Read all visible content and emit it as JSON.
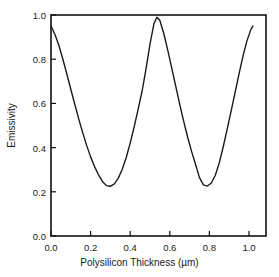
{
  "chart_data": {
    "type": "line",
    "title": "",
    "xlabel": "Polysilicon Thickness (µm)",
    "ylabel": "Emissivity",
    "xlim": [
      0.0,
      1.086
    ],
    "ylim": [
      0.0,
      1.0
    ],
    "xticks": [
      0.0,
      0.2,
      0.4,
      0.6,
      0.8,
      1.0
    ],
    "xtick_labels": [
      "0.0",
      "0.2",
      "0.4",
      "0.6",
      "0.8",
      "1.0"
    ],
    "yticks": [
      0.0,
      0.2,
      0.4,
      0.6,
      0.8,
      1.0
    ],
    "ytick_labels": [
      "0.0",
      "0.2",
      "0.4",
      "0.6",
      "0.8",
      "1.0"
    ],
    "grid": false,
    "legend": false,
    "tick_direction": "in",
    "line_color": "#1a1a1a",
    "line_width": 1.4,
    "frame_color": "#111111",
    "background": "#fefefe",
    "annotations": [
      {
        "label": "start",
        "x": 0.0,
        "y": 0.95
      },
      {
        "label": "minimum-1",
        "x": 0.265,
        "y": 0.225
      },
      {
        "label": "maximum",
        "x": 0.535,
        "y": 0.99
      },
      {
        "label": "minimum-2",
        "x": 0.745,
        "y": 0.225
      },
      {
        "label": "end",
        "x": 1.02,
        "y": 0.95
      }
    ],
    "series": [
      {
        "name": "Emissivity",
        "x": [
          0.0,
          0.02,
          0.04,
          0.06,
          0.08,
          0.1,
          0.12,
          0.14,
          0.16,
          0.18,
          0.2,
          0.22,
          0.24,
          0.26,
          0.28,
          0.3,
          0.32,
          0.34,
          0.36,
          0.38,
          0.4,
          0.42,
          0.44,
          0.46,
          0.48,
          0.5,
          0.52,
          0.535,
          0.55,
          0.57,
          0.59,
          0.61,
          0.63,
          0.65,
          0.67,
          0.69,
          0.71,
          0.73,
          0.75,
          0.77,
          0.79,
          0.81,
          0.83,
          0.85,
          0.87,
          0.89,
          0.91,
          0.93,
          0.95,
          0.97,
          0.99,
          1.01,
          1.02
        ],
        "y": [
          0.95,
          0.912,
          0.862,
          0.8,
          0.733,
          0.664,
          0.596,
          0.53,
          0.468,
          0.41,
          0.358,
          0.314,
          0.277,
          0.247,
          0.228,
          0.225,
          0.236,
          0.262,
          0.302,
          0.355,
          0.42,
          0.494,
          0.573,
          0.655,
          0.756,
          0.868,
          0.961,
          0.99,
          0.975,
          0.915,
          0.84,
          0.76,
          0.678,
          0.597,
          0.52,
          0.448,
          0.383,
          0.325,
          0.264,
          0.231,
          0.226,
          0.24,
          0.275,
          0.331,
          0.404,
          0.484,
          0.566,
          0.65,
          0.735,
          0.815,
          0.884,
          0.935,
          0.95
        ]
      }
    ]
  },
  "figure": {
    "axis_label_x": "Polysilicon Thickness (µm)",
    "axis_label_y": "Emissivity"
  }
}
